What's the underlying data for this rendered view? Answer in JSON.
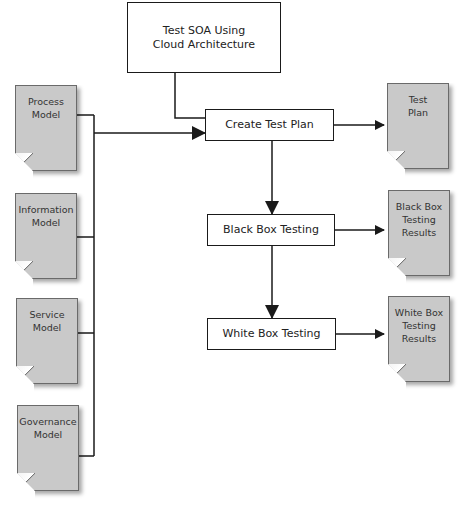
{
  "diagram": {
    "top_box": {
      "label": "Test SOA Using Cloud Architecture"
    },
    "process_steps": [
      {
        "label": "Create Test Plan"
      },
      {
        "label": "Black Box Testing"
      },
      {
        "label": "White Box Testing"
      }
    ],
    "input_documents": [
      {
        "label": "Process Model"
      },
      {
        "label": "Information Model"
      },
      {
        "label": "Service Model"
      },
      {
        "label": "Governance Model"
      }
    ],
    "output_documents": [
      {
        "label": "Test Plan"
      },
      {
        "label": "Black Box Testing Results"
      },
      {
        "label": "White Box Testing Results"
      }
    ],
    "colors": {
      "document_fill": "#c9c9c9",
      "line": "#1a1a1a",
      "box_fill": "#ffffff"
    }
  }
}
